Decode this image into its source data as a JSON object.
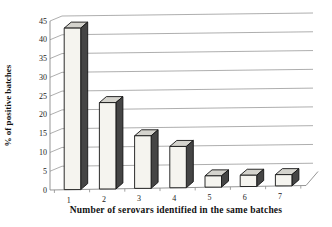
{
  "chart_data": {
    "type": "bar",
    "style": "3d-column",
    "title": "",
    "xlabel": "Number of serovars identified in the same batches",
    "ylabel": "% of positive batches",
    "categories": [
      "1",
      "2",
      "3",
      "4",
      "5",
      "6",
      "7"
    ],
    "values": [
      43,
      23,
      14,
      11,
      3,
      3,
      3
    ],
    "ylim": [
      0,
      45
    ],
    "ytick_step": 5,
    "grid": true,
    "legend": false
  },
  "colors": {
    "background": "#ffffff",
    "bar_front": "#f5f4ef",
    "bar_top": "#d4d3cd",
    "bar_side": "#454545",
    "outline": "#141414",
    "gridline": "#999999",
    "axis": "#8a8a8a",
    "text": "#1a1a1a"
  }
}
